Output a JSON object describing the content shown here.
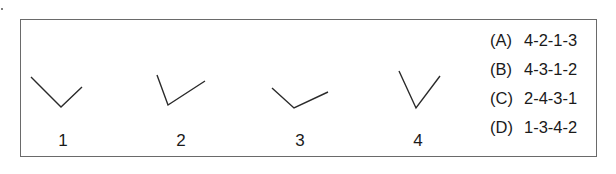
{
  "figure": {
    "shapes": [
      {
        "label": "1",
        "points": [
          [
            31,
            77
          ],
          [
            61,
            107
          ],
          [
            82,
            87
          ]
        ]
      },
      {
        "label": "2",
        "points": [
          [
            157,
            75
          ],
          [
            168,
            105
          ],
          [
            205,
            81
          ]
        ]
      },
      {
        "label": "3",
        "points": [
          [
            272,
            88
          ],
          [
            294,
            108
          ],
          [
            328,
            92
          ]
        ]
      },
      {
        "label": "4",
        "points": [
          [
            399,
            71
          ],
          [
            416,
            108
          ],
          [
            440,
            76
          ]
        ]
      }
    ],
    "labels": [
      "1",
      "2",
      "3",
      "4"
    ]
  },
  "options": [
    {
      "key": "(A)",
      "value": "4-2-1-3"
    },
    {
      "key": "(B)",
      "value": "4-3-1-2"
    },
    {
      "key": "(C)",
      "value": "2-4-3-1"
    },
    {
      "key": "(D)",
      "value": "1-3-4-2"
    }
  ],
  "colors": {
    "stroke": "#2a2a2a",
    "border": "#6a6a6a"
  }
}
